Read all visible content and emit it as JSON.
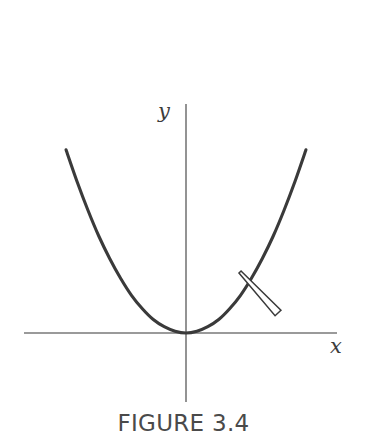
{
  "figure": {
    "caption": "FIGURE 3.4",
    "background_color": "#ffffff"
  },
  "axes": {
    "x_label": "x",
    "y_label": "y",
    "axis_color": "#787878",
    "x_axis": {
      "x1": 24,
      "y1": 333,
      "x2": 337,
      "y2": 333
    },
    "y_axis": {
      "x1": 186,
      "y1": 104,
      "x2": 186,
      "y2": 402
    }
  },
  "annotation": {
    "pointer_name": "tangent-pointer-arrow",
    "outline_color": "#3a3a3a",
    "fill_color": "#ffffff",
    "tip": {
      "x": 240,
      "y": 272
    },
    "tail": {
      "x": 278,
      "y": 313
    }
  },
  "chart_data": {
    "type": "line",
    "title": "FIGURE 3.4",
    "xlabel": "x",
    "ylabel": "y",
    "grid": false,
    "legend": null,
    "annotations": [
      {
        "type": "pointer",
        "label": "",
        "points_to": {
          "x": 0.72,
          "y": 0.52
        }
      }
    ],
    "axis_ranges": {
      "x": [
        -1.85,
        1.8
      ],
      "y": [
        -0.45,
        2.55
      ]
    },
    "series": [
      {
        "name": "y = x^2",
        "curve_color": "#3a3a3a",
        "x": [
          -1.43,
          -1.3,
          -1.17,
          -1.04,
          -0.91,
          -0.78,
          -0.65,
          -0.52,
          -0.39,
          -0.26,
          -0.13,
          0.0,
          0.13,
          0.26,
          0.39,
          0.52,
          0.65,
          0.78,
          0.91,
          1.04,
          1.17,
          1.3,
          1.43
        ],
        "y": [
          2.04,
          1.69,
          1.37,
          1.08,
          0.83,
          0.61,
          0.42,
          0.27,
          0.15,
          0.07,
          0.02,
          0.0,
          0.02,
          0.07,
          0.15,
          0.27,
          0.42,
          0.61,
          0.83,
          1.08,
          1.37,
          1.69,
          2.04
        ]
      }
    ],
    "vertex": {
      "x": 0,
      "y": 0
    }
  }
}
